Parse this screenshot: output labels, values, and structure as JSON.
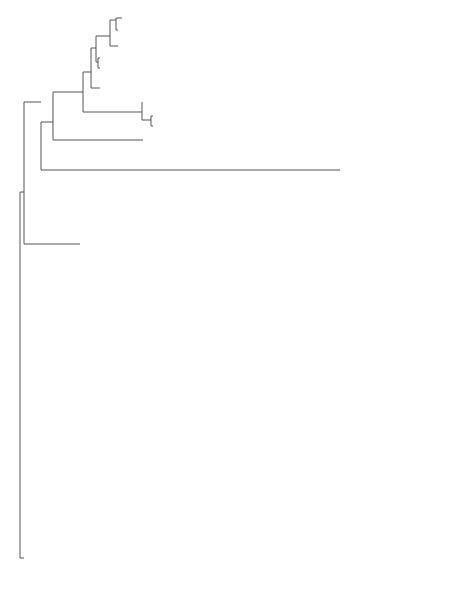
{
  "figure": {
    "type": "phylogenetic-tree",
    "scale_bar": {
      "label": "0.02"
    },
    "clades": [
      {
        "name": "Actinobacteria"
      },
      {
        "name": "Chlorobi"
      },
      {
        "name": "Proteobacteria"
      },
      {
        "name": "Chloroflexi and",
        "name2": "Firmicutes"
      }
    ],
    "taxa": {
      "actinomadura": "Actinomadura",
      "spirillospora": "Spirillospora",
      "h": "h (KF952591)",
      "sporichthyaceae": "Sporichthyaceae",
      "thermomonosporaceae": "Thermomonosporaceae",
      "i": "i (KF952592)",
      "conexibacter": "Conexibacter",
      "thermoleophilaceae": "Thermoleophilaceae",
      "c": "c (KF952586)",
      "actinomycetales": "Actinomycetales",
      "candidatus": "Candidatus",
      "m": "m (KF952596)",
      "chlorobi": "Chlorobi",
      "l": "l (KF952595)",
      "chlorobium": "Chlorobium",
      "sphingobium": "Sphingobium",
      "d": "d (KF952587)",
      "sphingomonas": "Sphingomonas",
      "reyranella": "Reyranella",
      "a": "a (KF952584)",
      "pseudomonas": "Pseudomonas",
      "acidimicrobiaceae": "Acidimicrobiaceae",
      "g": "g (KF952590)",
      "steroidobacter": "Steroidobacter",
      "pseudoxanthomonas": "Pseudoxanthomonas",
      "k": "k (KF952594)",
      "dokdonella": "Dokdonella",
      "anaerolineae": "Anaerolineae",
      "b": "b (KF952585)",
      "anaerolineaceae": "Anaerolineaceae",
      "j": "j (KF952593)",
      "caldilineaceae": "Caldilineaceae",
      "thermanaerothrix": "Thermanaerothrix",
      "bellilinea": "Bellilinea",
      "thermolithobacter": "Thermolithobacter",
      "e": "e (KF952588)",
      "bacillus": "Bacillus",
      "f": "f (KF952589)",
      "sporosarcina": "Sporosarcina"
    },
    "bootstrap": {
      "n53a": "53",
      "n70a": "70",
      "n57": "57",
      "n79a": "79",
      "n43": "43",
      "n68": "68",
      "n99a": "99",
      "n75a": "75",
      "n35": "35",
      "n44": "44",
      "n100a": "100",
      "n70b": "70",
      "n100b": "100",
      "n74": "74",
      "n100c": "100",
      "n100d": "100",
      "n90": "90",
      "n78": "78",
      "n99b": "99",
      "n99c": "99",
      "n70c": "70",
      "n97": "97",
      "n64": "64",
      "n81": "81",
      "n92": "92",
      "n53b": "53",
      "n98": "98",
      "n88a": "88",
      "n88b": "88",
      "n79b": "79",
      "n100e": "100",
      "n71": "71",
      "n100f": "100",
      "n75b": "75"
    }
  }
}
